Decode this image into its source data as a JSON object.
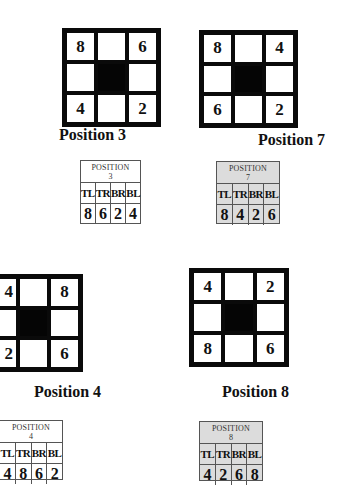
{
  "diagrams": [
    {
      "id": "pos3",
      "label": "Position 3",
      "cells": [
        "8",
        "",
        "6",
        "",
        "",
        "",
        "4",
        "",
        "2"
      ]
    },
    {
      "id": "pos7",
      "label": "Position 7",
      "cells": [
        "8",
        "",
        "4",
        "",
        "",
        "",
        "6",
        "",
        "2"
      ]
    },
    {
      "id": "pos4",
      "label": "Position 4",
      "cells": [
        "4",
        "",
        "8",
        "",
        "",
        "",
        "2",
        "",
        "6"
      ]
    },
    {
      "id": "pos8",
      "label": "Position 8",
      "cells": [
        "4",
        "",
        "2",
        "",
        "",
        "",
        "8",
        "",
        "6"
      ]
    }
  ],
  "tables": [
    {
      "id": "pos3",
      "title_line1": "POSITION",
      "title_line2": "3",
      "keys": [
        "TL",
        "TR",
        "BR",
        "BL"
      ],
      "values": [
        "8",
        "6",
        "2",
        "4"
      ],
      "shaded": false
    },
    {
      "id": "pos7",
      "title_line1": "POSITION",
      "title_line2": "7",
      "keys": [
        "TL",
        "TR",
        "BR",
        "BL"
      ],
      "values": [
        "8",
        "4",
        "2",
        "6"
      ],
      "shaded": true
    },
    {
      "id": "pos4",
      "title_line1": "POSITION",
      "title_line2": "4",
      "keys": [
        "TL",
        "TR",
        "BR",
        "BL"
      ],
      "values": [
        "4",
        "8",
        "6",
        "2"
      ],
      "shaded": false
    },
    {
      "id": "pos8",
      "title_line1": "POSITION",
      "title_line2": "8",
      "keys": [
        "TL",
        "TR",
        "BR",
        "BL"
      ],
      "values": [
        "4",
        "2",
        "6",
        "8"
      ],
      "shaded": true
    }
  ],
  "colors": {
    "grid_border": "#0a0a0a",
    "center_cell": "#050505",
    "shaded_table": "#dcdcdc"
  }
}
